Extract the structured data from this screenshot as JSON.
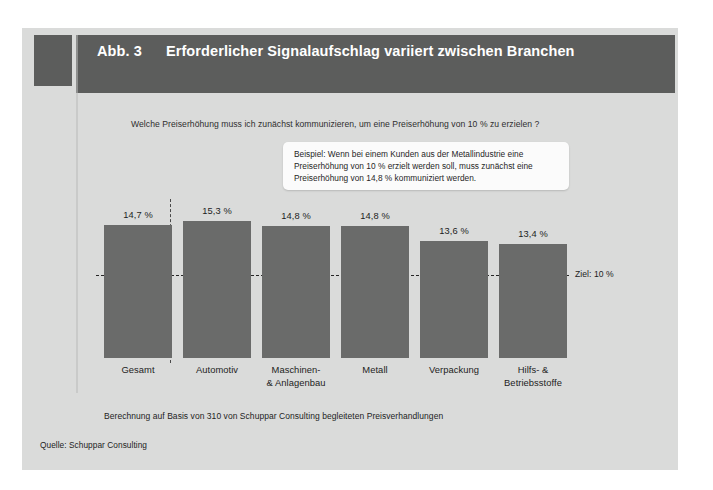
{
  "figure": {
    "number_label": "Abb. 3",
    "title": "Erforderlicher Signalaufschlag variiert zwischen Branchen",
    "question": "Welche Preiserhöhung muss ich zunächst kommunizieren, um eine Preiserhöhung von 10 % zu erzielen ?",
    "callout": "Beispiel: Wenn bei einem Kunden aus der Metallindustrie eine Preiserhöhung von 10 % erzielt werden soll, muss zunächst eine Preiserhöhung von 14,8 % kommuniziert werden.",
    "footnote": "Berechnung auf Basis von 310 von Schuppar Consulting begleiteten Preisverhandlungen",
    "source": "Quelle: Schuppar Consulting",
    "target_label": "Ziel: 10 %"
  },
  "colors": {
    "banner": "#5c5d5c",
    "panel": "#dadbda",
    "bar": "#6a6b6a",
    "text": "#1d1d1d",
    "callout_bg": "#fbfbfb",
    "dash": "#262626"
  },
  "chart_data": {
    "type": "bar",
    "title": "Erforderlicher Signalaufschlag variiert zwischen Branchen",
    "subtitle": "Welche Preiserhöhung muss ich zunächst kommunizieren, um eine Preiserhöhung von 10 % zu erzielen ?",
    "xlabel": "",
    "ylabel": "Erforderlicher Signalaufschlag (%)",
    "categories": [
      "Gesamt",
      "Automotiv",
      "Maschinen-\n& Anlagenbau",
      "Metall",
      "Verpackung",
      "Hilfs- &\nBetriebsstoffe"
    ],
    "values": [
      14.7,
      15.3,
      14.8,
      14.8,
      13.6,
      13.4
    ],
    "value_labels": [
      "14,7 %",
      "15,3 %",
      "14,8 %",
      "14,8 %",
      "13,6 %",
      "13,4 %"
    ],
    "category_lines": [
      [
        "Gesamt"
      ],
      [
        "Automotiv"
      ],
      [
        "Maschinen-",
        "& Anlagenbau"
      ],
      [
        "Metall"
      ],
      [
        "Verpackung"
      ],
      [
        "Hilfs- &",
        "Betriebsstoffe"
      ]
    ],
    "reference_line": {
      "value": 10,
      "label": "Ziel: 10 %",
      "style": "dashed"
    },
    "grid": false,
    "legend": "none",
    "unit": "%",
    "note": "Berechnung auf Basis von 310 von Schuppar Consulting begleiteten Preisverhandlungen",
    "source": "Quelle: Schuppar Consulting"
  },
  "geometry": {
    "baseline_y": 358,
    "bar_width": 68,
    "bar_x": [
      104,
      183,
      262,
      341,
      420,
      499
    ],
    "bar_top_y": [
      225,
      221,
      226,
      226,
      241,
      244
    ],
    "label_top_y": [
      210,
      206,
      211,
      211,
      226,
      229
    ],
    "cat_label_y": 364
  }
}
